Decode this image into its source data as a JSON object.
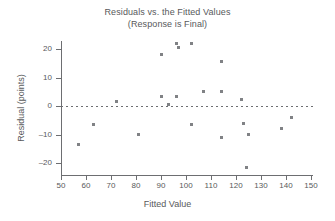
{
  "chart_data": {
    "type": "scatter",
    "title": "Residuals vs. the Fitted Values",
    "subtitle": "(Response is Final)",
    "xlabel": "Fitted Value",
    "ylabel": "Residual (points)",
    "xlim": [
      50,
      150
    ],
    "ylim": [
      -22,
      23
    ],
    "xticks": [
      50,
      60,
      70,
      80,
      90,
      100,
      110,
      120,
      130,
      140,
      150
    ],
    "yticks": [
      20,
      10,
      0,
      -10,
      -20
    ],
    "grid": false,
    "legend": null,
    "reference_line": {
      "axis": "y",
      "value": 0,
      "style": "dashed"
    },
    "marker": {
      "shape": "square",
      "color": "#808285",
      "size": 3
    },
    "x": [
      57,
      63,
      72,
      81,
      90,
      90,
      93,
      96,
      96,
      97,
      102,
      102,
      107,
      114,
      114,
      114,
      122,
      123,
      123,
      124,
      125,
      138,
      142
    ],
    "y": [
      -13.5,
      -6.5,
      1.5,
      -10,
      18,
      3.2,
      0.5,
      22,
      3.5,
      20.5,
      22,
      -6.5,
      5,
      15.5,
      5,
      -11,
      2.2,
      -6,
      -6,
      -21.5,
      -10,
      -8,
      -4
    ],
    "points": [
      {
        "x": 57,
        "y": -13.5
      },
      {
        "x": 63,
        "y": -6.5
      },
      {
        "x": 72,
        "y": 1.5
      },
      {
        "x": 81,
        "y": -10
      },
      {
        "x": 90,
        "y": 18
      },
      {
        "x": 90,
        "y": 3.2
      },
      {
        "x": 93,
        "y": 0.5
      },
      {
        "x": 96,
        "y": 22
      },
      {
        "x": 96,
        "y": 3.5
      },
      {
        "x": 97,
        "y": 20.5
      },
      {
        "x": 102,
        "y": 22
      },
      {
        "x": 102,
        "y": -6.5
      },
      {
        "x": 107,
        "y": 5
      },
      {
        "x": 114,
        "y": 15.5
      },
      {
        "x": 114,
        "y": 5
      },
      {
        "x": 114,
        "y": -11
      },
      {
        "x": 122,
        "y": 2.2
      },
      {
        "x": 123,
        "y": -6
      },
      {
        "x": 123,
        "y": -6
      },
      {
        "x": 124,
        "y": -21.5
      },
      {
        "x": 125,
        "y": -10
      },
      {
        "x": 138,
        "y": -8
      },
      {
        "x": 142,
        "y": -4
      }
    ]
  },
  "colors": {
    "axis": "#6d6e71",
    "text": "#58595b",
    "marker": "#808285",
    "background": "#ffffff"
  }
}
